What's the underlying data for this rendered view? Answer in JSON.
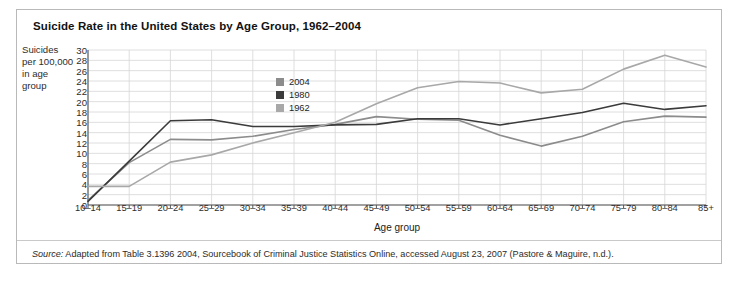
{
  "figure": {
    "title": "Suicide Rate in the United States by Age Group, 1962–2004",
    "y_axis_label": "Suicides per 100,000 in age group",
    "x_axis_label": "Age group",
    "source_prefix": "Source:",
    "source_text": " Adapted from Table 3.1396 2004, Sourcebook of Criminal Justice Statistics Online, accessed August 23, 2007 (Pastore & Maguire, n.d.)."
  },
  "legend": {
    "position": "inside-upper-center",
    "items": [
      {
        "label": "2004",
        "color": "#8c8c8c"
      },
      {
        "label": "1980",
        "color": "#3b3b3b"
      },
      {
        "label": "1962",
        "color": "#a8a8a8"
      }
    ]
  },
  "chart_data": {
    "type": "line",
    "title": "Suicide Rate in the United States by Age Group, 1962–2004",
    "xlabel": "Age group",
    "ylabel": "Suicides per 100,000 in age group",
    "ylim": [
      0,
      30
    ],
    "ytick_step": 2,
    "yticks": [
      30,
      28,
      26,
      24,
      22,
      20,
      18,
      16,
      14,
      12,
      10,
      8,
      6,
      4,
      2,
      0
    ],
    "grid": true,
    "legend_position": "inside-upper-center",
    "categories": [
      "10–14",
      "15–19",
      "20–24",
      "25–29",
      "30–34",
      "35–39",
      "40–44",
      "45–49",
      "50–54",
      "55–59",
      "60–64",
      "65–69",
      "70–74",
      "75–79",
      "80–84",
      "85+"
    ],
    "series": [
      {
        "name": "2004",
        "color": "#8c8c8c",
        "values": [
          0.9,
          8.2,
          12.7,
          12.6,
          13.3,
          14.6,
          15.6,
          17.1,
          16.6,
          16.4,
          13.5,
          11.4,
          13.3,
          16.1,
          17.2,
          17.0
        ]
      },
      {
        "name": "1980",
        "color": "#3b3b3b",
        "values": [
          0.7,
          8.5,
          16.3,
          16.5,
          15.2,
          15.2,
          15.5,
          15.6,
          16.7,
          16.7,
          15.5,
          16.7,
          17.9,
          19.7,
          18.5,
          19.2
        ]
      },
      {
        "name": "1962",
        "color": "#a8a8a8",
        "values": [
          3.6,
          3.6,
          8.3,
          9.7,
          12.0,
          14.0,
          16.0,
          19.6,
          22.7,
          23.9,
          23.6,
          21.7,
          22.4,
          26.3,
          29.0,
          26.7
        ]
      }
    ]
  }
}
